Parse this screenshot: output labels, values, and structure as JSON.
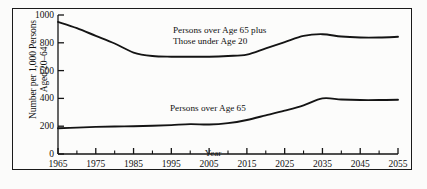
{
  "chart_data": {
    "type": "line",
    "title": "",
    "xlabel": "Year",
    "ylabel_line1": "Number per 1,000 Persons",
    "ylabel_line2": "Aged 20–64",
    "xlim": [
      1965,
      2055
    ],
    "ylim": [
      0,
      1000
    ],
    "yticks": [
      0,
      200,
      400,
      600,
      800,
      1000
    ],
    "ytick_labels": [
      "0",
      "200",
      "400",
      "600",
      "800",
      "1000"
    ],
    "xticks": [
      1965,
      1975,
      1985,
      1995,
      2005,
      2015,
      2025,
      2035,
      2045,
      2055
    ],
    "xtick_labels": [
      "1965",
      "1975",
      "1985",
      "1995",
      "2005",
      "2015",
      "2025",
      "2035",
      "2045",
      "2055"
    ],
    "x_minor_tick_interval": 5,
    "grid": false,
    "legend_position": "inline-annotations",
    "line_color": "#141414",
    "background_color": "#fcfcfb",
    "frame_color": "#1a1a1a",
    "x": [
      1965,
      1970,
      1975,
      1980,
      1985,
      1990,
      1995,
      2000,
      2005,
      2010,
      2015,
      2020,
      2025,
      2030,
      2035,
      2040,
      2045,
      2050,
      2055
    ],
    "series": [
      {
        "name": "Persons over Age 65 plus Those under Age 20",
        "annotation_line1": "Persons over Age 65 plus",
        "annotation_line2": "Those under Age 20",
        "values": [
          950,
          905,
          850,
          795,
          730,
          705,
          700,
          700,
          700,
          705,
          715,
          760,
          805,
          850,
          862,
          845,
          838,
          838,
          843
        ]
      },
      {
        "name": "Persons over Age 65",
        "annotation_line1": "Persons over Age 65",
        "annotation_line2": "",
        "values": [
          185,
          190,
          195,
          198,
          200,
          203,
          208,
          215,
          212,
          222,
          245,
          278,
          312,
          350,
          400,
          392,
          388,
          388,
          390
        ]
      }
    ]
  }
}
